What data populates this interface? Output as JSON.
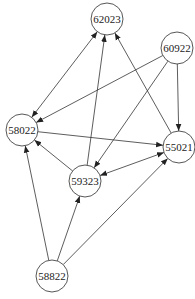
{
  "diagram": {
    "type": "directed-graph",
    "node_radius": 16,
    "colors": {
      "background": "#ffffff",
      "edge": "#333333",
      "node_stroke": "#444444",
      "label": "#222222"
    },
    "nodes": [
      {
        "id": "62023",
        "label": "62023",
        "x": 107,
        "y": 19
      },
      {
        "id": "60922",
        "label": "60922",
        "x": 177,
        "y": 48
      },
      {
        "id": "58022",
        "label": "58022",
        "x": 22,
        "y": 130
      },
      {
        "id": "55021",
        "label": "55021",
        "x": 179,
        "y": 147
      },
      {
        "id": "59323",
        "label": "59323",
        "x": 85,
        "y": 181
      },
      {
        "id": "58822",
        "label": "58822",
        "x": 52,
        "y": 276
      }
    ],
    "edges": [
      {
        "from": "58022",
        "to": "62023",
        "bidirectional": true
      },
      {
        "from": "60922",
        "to": "58022",
        "bidirectional": false
      },
      {
        "from": "59323",
        "to": "62023",
        "bidirectional": false
      },
      {
        "from": "55021",
        "to": "62023",
        "bidirectional": false
      },
      {
        "from": "60922",
        "to": "59323",
        "bidirectional": false
      },
      {
        "from": "60922",
        "to": "55021",
        "bidirectional": false
      },
      {
        "from": "58022",
        "to": "55021",
        "bidirectional": false
      },
      {
        "from": "59323",
        "to": "58022",
        "bidirectional": false
      },
      {
        "from": "59323",
        "to": "55021",
        "bidirectional": true
      },
      {
        "from": "58822",
        "to": "58022",
        "bidirectional": false
      },
      {
        "from": "58822",
        "to": "59323",
        "bidirectional": false
      },
      {
        "from": "58822",
        "to": "55021",
        "bidirectional": false
      }
    ]
  }
}
